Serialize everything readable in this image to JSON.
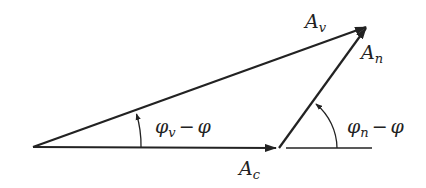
{
  "diagram": {
    "type": "phasor-vector-diagram",
    "colors": {
      "stroke": "#222222",
      "background": "#ffffff"
    },
    "vectors": [
      {
        "name": "A_c",
        "base": "A",
        "sub": "c",
        "from": [
          33,
          147
        ],
        "to": [
          276,
          148
        ]
      },
      {
        "name": "A_n",
        "base": "A",
        "sub": "n",
        "from": [
          279,
          148
        ],
        "to": [
          366,
          27
        ]
      },
      {
        "name": "A_v",
        "base": "A",
        "sub": "v",
        "from": [
          33,
          147
        ],
        "to": [
          366,
          27
        ]
      }
    ],
    "reference_line": {
      "from": [
        286,
        148
      ],
      "to": [
        372,
        148
      ]
    },
    "angles": [
      {
        "name": "phi_v_minus_phi",
        "base": "φ",
        "sub": "v",
        "op": "−",
        "rhs": "φ"
      },
      {
        "name": "phi_n_minus_phi",
        "base": "φ",
        "sub": "n",
        "op": "−",
        "rhs": "φ"
      }
    ],
    "labels": {
      "A_v": {
        "base": "A",
        "sub": "v"
      },
      "A_n": {
        "base": "A",
        "sub": "n"
      },
      "A_c": {
        "base": "A",
        "sub": "c"
      },
      "angle_v": {
        "base": "φ",
        "sub": "v",
        "op": "−",
        "rhs": "φ"
      },
      "angle_n": {
        "base": "φ",
        "sub": "n",
        "op": "−",
        "rhs": "φ"
      }
    }
  }
}
